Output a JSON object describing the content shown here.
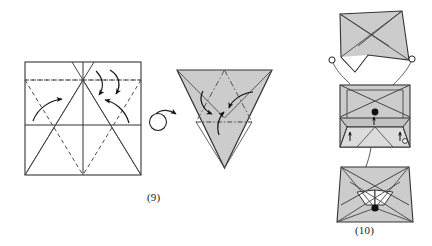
{
  "figure": {
    "kind": "origami-folding-diagram",
    "title_visible": false,
    "background_color": "#ffffff",
    "paper_fill_color": "#cccccc",
    "paper_fill_color_light": "#d9d9d9",
    "line_color": "#333333",
    "crease_color": "#4d4d4d",
    "arrow_color": "#111111"
  },
  "captions": {
    "step_9": "(9)",
    "step_10": "(10)"
  },
  "panels": {
    "step9_square": {
      "label": "crease-pattern-square",
      "caption": "(9)",
      "description": "Unfolded square sheet with valley and mountain crease lines and four fold arrows",
      "fill": "#ffffff",
      "arrow_count": 4,
      "solid_creases": 9,
      "dashed_creases": 6
    },
    "turn_over_symbol": {
      "label": "turn-over-arrow",
      "description": "Circular loop arrow indicating turn the model over"
    },
    "step9_triangle": {
      "label": "folded-triangle",
      "caption": "(9)",
      "description": "Gray downward pointing triangle with internal creases and three fold arrows",
      "fill": "#cccccc",
      "arrow_count": 3
    },
    "step10_top": {
      "label": "step10-top-shape",
      "description": "Gray trapezoid-like shape with notched bottom and two small open circles",
      "fill": "#cccccc",
      "open_circles": 2
    },
    "step10_middle": {
      "label": "step10-middle-shape",
      "description": "Gray square shape with internal creases, one filled dot and small arrows",
      "fill": "#cccccc",
      "filled_dots": 1
    },
    "step10_bottom": {
      "label": "step10-bottom-shape",
      "description": "Gray star-like shape with white notches and one filled dot",
      "caption": "(10)",
      "fill": "#cccccc",
      "filled_dots": 1
    }
  },
  "legend": {
    "solid_line": "mountain / edge",
    "dashed_line": "valley crease",
    "arrow": "fold direction",
    "open_circle": "reference point (open)",
    "filled_circle": "reference point (filled)"
  }
}
